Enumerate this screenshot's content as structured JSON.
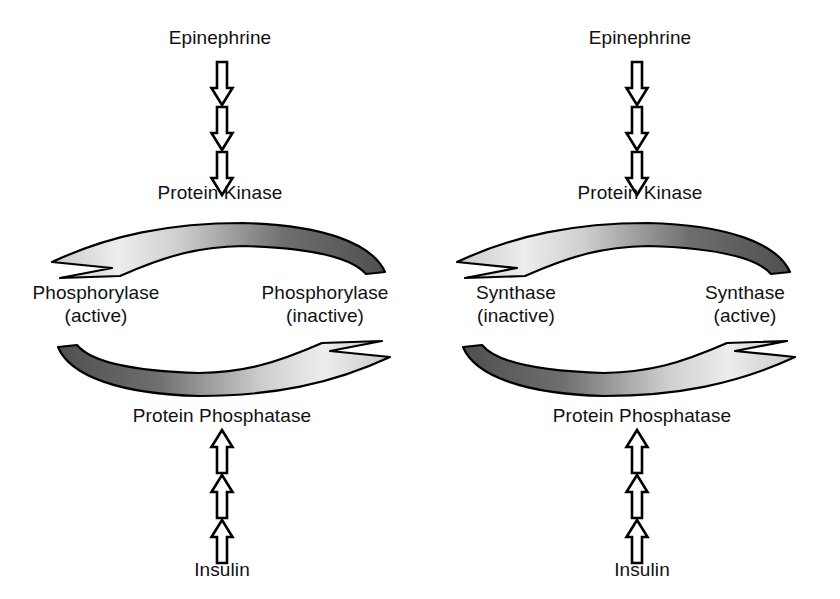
{
  "figure": {
    "background": "#ffffff",
    "text_color": "#111111",
    "arrow_outline_color": "#000000",
    "arrow_fill_hollow": "#ffffff",
    "curve_gradient_dark": "#5a5a5a",
    "curve_gradient_light": "#e8e8e8"
  },
  "panels": [
    {
      "id": "phosphorylase-cycle",
      "top_label": "Epinephrine",
      "upper_enzyme": "Protein Kinase",
      "left_node": "Phosphorylase\n(active)",
      "right_node": "Phosphorylase\n(inactive)",
      "lower_enzyme": "Protein Phosphatase",
      "bottom_label": "Insulin",
      "top_arrow_direction": "right-to-left",
      "bottom_arrow_direction": "left-to-right",
      "vertical_top_arrows": 3,
      "vertical_top_direction": "down",
      "vertical_bottom_arrows": 3,
      "vertical_bottom_direction": "up"
    },
    {
      "id": "synthase-cycle",
      "top_label": "Epinephrine",
      "upper_enzyme": "Protein Kinase",
      "left_node": "Synthase\n(inactive)",
      "right_node": "Synthase\n(active)",
      "lower_enzyme": "Protein Phosphatase",
      "bottom_label": "Insulin",
      "top_arrow_direction": "right-to-left",
      "bottom_arrow_direction": "left-to-right",
      "vertical_top_arrows": 3,
      "vertical_top_direction": "down",
      "vertical_bottom_arrows": 3,
      "vertical_bottom_direction": "up"
    }
  ]
}
